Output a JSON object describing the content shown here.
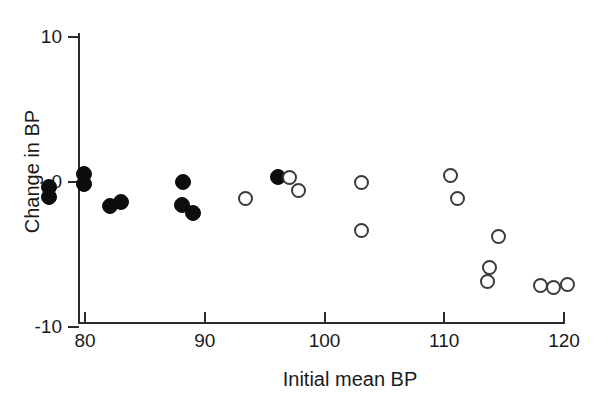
{
  "chart_data": {
    "type": "scatter",
    "title": "",
    "xlabel": "Initial mean BP",
    "ylabel": "Change in BP",
    "xlim": [
      73,
      120
    ],
    "ylim": [
      -10,
      10
    ],
    "xticks": [
      80,
      90,
      100,
      110,
      120
    ],
    "yticks": [
      -10,
      0,
      10
    ],
    "xtick_labels": [
      "80",
      "90",
      "100",
      "110",
      "120"
    ],
    "ytick_labels": [
      "-10",
      "0",
      "10"
    ],
    "grid": false,
    "legend": "none",
    "series": [
      {
        "name": "closed-circles",
        "marker": "filled-circle",
        "color": "#0d0d0d",
        "points": [
          {
            "x": 77.0,
            "y": -0.4
          },
          {
            "x": 77.0,
            "y": -1.1
          },
          {
            "x": 79.9,
            "y": 0.5
          },
          {
            "x": 79.9,
            "y": -0.2
          },
          {
            "x": 82.1,
            "y": -1.7
          },
          {
            "x": 83.0,
            "y": -1.4
          },
          {
            "x": 88.2,
            "y": 0.0
          },
          {
            "x": 88.1,
            "y": -1.6
          },
          {
            "x": 89.0,
            "y": -2.2
          },
          {
            "x": 96.1,
            "y": 0.3
          }
        ]
      },
      {
        "name": "open-circles",
        "marker": "open-circle",
        "color": "#3a3a3a",
        "points": [
          {
            "x": 93.4,
            "y": -1.2
          },
          {
            "x": 97.1,
            "y": 0.3
          },
          {
            "x": 97.8,
            "y": -0.6
          },
          {
            "x": 103.1,
            "y": -0.1
          },
          {
            "x": 103.1,
            "y": -3.4
          },
          {
            "x": 110.5,
            "y": 0.4
          },
          {
            "x": 111.1,
            "y": -1.2
          },
          {
            "x": 113.6,
            "y": -6.9
          },
          {
            "x": 113.8,
            "y": -5.9
          },
          {
            "x": 114.5,
            "y": -3.8
          },
          {
            "x": 118.0,
            "y": -7.2
          },
          {
            "x": 119.1,
            "y": -7.3
          },
          {
            "x": 120.3,
            "y": -7.1
          }
        ]
      }
    ]
  }
}
